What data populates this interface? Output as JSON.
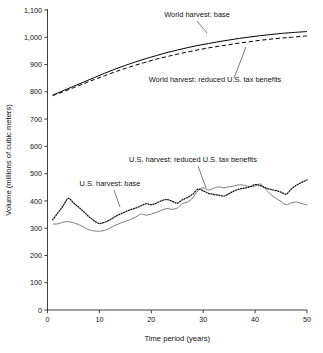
{
  "chart_data": {
    "type": "line",
    "title": "",
    "xlabel": "Time period (years)",
    "ylabel": "Volume (millions of cubic meters)",
    "xlim": [
      0,
      50
    ],
    "ylim": [
      0,
      1100
    ],
    "xticks": [
      0,
      10,
      20,
      30,
      40,
      50
    ],
    "xtick_labels": [
      "0",
      "10",
      "20",
      "30",
      "40",
      "50"
    ],
    "yticks": [
      0,
      100,
      200,
      300,
      400,
      500,
      600,
      700,
      800,
      900,
      1000,
      1100
    ],
    "ytick_labels": [
      "0",
      "100",
      "200",
      "300",
      "400",
      "500",
      "600",
      "700",
      "800",
      "900",
      "1,000",
      "1,100"
    ],
    "grid": false,
    "legend_position": "inline-annotations",
    "series": [
      {
        "name": "World harvest: base",
        "style": "solid",
        "color": "#000000",
        "x": [
          1,
          3,
          5,
          7,
          9,
          11,
          13,
          15,
          17,
          19,
          21,
          23,
          25,
          27,
          29,
          31,
          33,
          35,
          37,
          39,
          41,
          43,
          45,
          47,
          50
        ],
        "values": [
          788,
          804,
          820,
          836,
          852,
          868,
          883,
          897,
          910,
          922,
          933,
          944,
          953,
          962,
          970,
          977,
          984,
          990,
          996,
          1001,
          1006,
          1010,
          1014,
          1017,
          1021
        ]
      },
      {
        "name": "World harvest: reduced U.S. tax benefits",
        "style": "dashed",
        "color": "#000000",
        "x": [
          1,
          3,
          5,
          7,
          9,
          11,
          13,
          15,
          17,
          19,
          21,
          23,
          25,
          27,
          29,
          31,
          33,
          35,
          37,
          39,
          41,
          43,
          45,
          47,
          50
        ],
        "values": [
          786,
          800,
          815,
          830,
          845,
          859,
          873,
          886,
          898,
          909,
          920,
          929,
          938,
          946,
          954,
          961,
          967,
          973,
          979,
          984,
          989,
          993,
          997,
          1000,
          1005
        ]
      },
      {
        "name": "U.S. harvest: base",
        "style": "solid",
        "color": "#777777",
        "x": [
          1,
          2,
          3,
          4,
          5,
          6,
          7,
          8,
          9,
          10,
          11,
          12,
          13,
          14,
          15,
          16,
          17,
          18,
          19,
          20,
          21,
          22,
          23,
          24,
          25,
          26,
          27,
          28,
          29,
          30,
          31,
          32,
          33,
          34,
          35,
          36,
          37,
          38,
          39,
          40,
          41,
          42,
          43,
          44,
          45,
          46,
          47,
          48,
          49,
          50
        ],
        "values": [
          315,
          316,
          322,
          324,
          320,
          313,
          304,
          294,
          290,
          289,
          292,
          300,
          310,
          318,
          325,
          332,
          341,
          352,
          348,
          352,
          358,
          366,
          372,
          369,
          374,
          390,
          396,
          412,
          437,
          448,
          440,
          446,
          452,
          448,
          452,
          455,
          459,
          457,
          452,
          455,
          462,
          444,
          424,
          410,
          398,
          386,
          393,
          396,
          390,
          385
        ]
      },
      {
        "name": "U.S. harvest: reduced U.S. tax benefits",
        "style": "dotted",
        "color": "#111111",
        "x": [
          1,
          2,
          3,
          4,
          5,
          6,
          7,
          8,
          9,
          10,
          11,
          12,
          13,
          14,
          15,
          16,
          17,
          18,
          19,
          20,
          21,
          22,
          23,
          24,
          25,
          26,
          27,
          28,
          29,
          30,
          31,
          32,
          33,
          34,
          35,
          36,
          37,
          38,
          39,
          40,
          41,
          42,
          43,
          44,
          45,
          46,
          47,
          48,
          49,
          50
        ],
        "values": [
          331,
          356,
          382,
          409,
          393,
          377,
          360,
          342,
          327,
          317,
          322,
          330,
          342,
          352,
          360,
          368,
          374,
          382,
          390,
          386,
          392,
          401,
          405,
          399,
          392,
          404,
          413,
          425,
          443,
          437,
          428,
          424,
          421,
          418,
          427,
          437,
          444,
          447,
          452,
          460,
          456,
          448,
          442,
          438,
          432,
          425,
          444,
          458,
          468,
          477
        ]
      }
    ],
    "annotations": [
      {
        "text": "World harvest: base",
        "label_x": 197,
        "label_y": 17,
        "leader": {
          "x1": 197,
          "y1": 21,
          "x2": 207,
          "y2": 33
        }
      },
      {
        "text": "World harvest: reduced U.S. tax benefits",
        "label_x": 215,
        "label_y": 82,
        "leader": {
          "x1": 234,
          "y1": 78,
          "x2": 246,
          "y2": 47
        }
      },
      {
        "text": "U.S. harvest: reduced U.S. tax benefits",
        "label_x": 193,
        "label_y": 162,
        "leader": {
          "x1": 198,
          "y1": 166,
          "x2": 206,
          "y2": 188
        }
      },
      {
        "text": "U.S. harvest: base",
        "label_x": 110,
        "label_y": 186,
        "leader": {
          "x1": 114,
          "y1": 190,
          "x2": 120,
          "y2": 207
        }
      }
    ]
  }
}
